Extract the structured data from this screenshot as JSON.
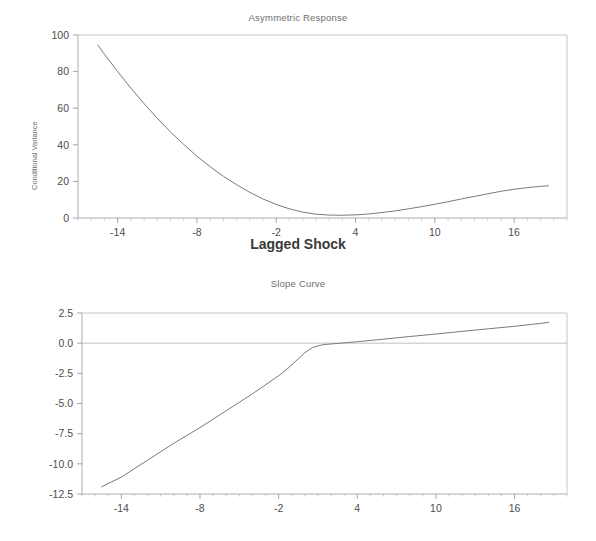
{
  "figure": {
    "width": 596,
    "height": 541,
    "background": "#ffffff",
    "line_color": "#7a7a7a",
    "text_color": "#4d4d4d",
    "axis_color": "#9a9a9a"
  },
  "chart_data": [
    {
      "type": "line",
      "title": "Asymmetric Response",
      "xlabel": "Lagged Shock",
      "ylabel": "Conditional Variance",
      "xlim": [
        -17,
        20
      ],
      "ylim": [
        0,
        100
      ],
      "xticks": [
        -14,
        -8,
        -2,
        4,
        10,
        16
      ],
      "xtick_labels": [
        "-14",
        "-8",
        "-2",
        "4",
        "10",
        "16"
      ],
      "yticks": [
        0,
        20,
        40,
        60,
        80,
        100
      ],
      "ytick_labels": [
        "0",
        "20",
        "40",
        "60",
        "80",
        "100"
      ],
      "grid": false,
      "legend": "none",
      "series": [
        {
          "name": "Conditional Variance",
          "x": [
            -15.5,
            -15.0,
            -14.0,
            -13.0,
            -12.0,
            -11.0,
            -10.0,
            -9.0,
            -8.0,
            -7.0,
            -6.0,
            -5.0,
            -4.0,
            -3.0,
            -2.0,
            -1.0,
            0.0,
            1.0,
            2.0,
            3.0,
            4.0,
            5.0,
            6.0,
            7.0,
            8.0,
            9.0,
            10.0,
            11.0,
            12.0,
            13.0,
            14.0,
            15.0,
            16.0,
            17.0,
            18.0,
            18.6
          ],
          "y": [
            94.5,
            89.5,
            80.0,
            71.0,
            62.5,
            54.5,
            47.0,
            40.2,
            33.8,
            28.0,
            22.8,
            18.2,
            14.0,
            10.4,
            7.4,
            5.0,
            3.2,
            2.1,
            1.6,
            1.5,
            1.7,
            2.2,
            3.0,
            3.9,
            5.0,
            6.2,
            7.5,
            8.9,
            10.4,
            11.8,
            13.2,
            14.6,
            15.7,
            16.6,
            17.3,
            17.6
          ]
        }
      ]
    },
    {
      "type": "line",
      "title": "Slope Curve",
      "xlabel": "",
      "ylabel": "",
      "xlim": [
        -17,
        20
      ],
      "ylim": [
        -12.5,
        2.5
      ],
      "xticks": [
        -14,
        -8,
        -2,
        4,
        10,
        16
      ],
      "xtick_labels": [
        "-14",
        "-8",
        "-2",
        "4",
        "10",
        "16"
      ],
      "yticks": [
        2.5,
        0.0,
        -2.5,
        -5.0,
        -7.5,
        -10.0,
        -12.5
      ],
      "ytick_labels": [
        "2.5",
        "0.0",
        "-2.5",
        "-5.0",
        "-7.5",
        "-10.0",
        "-12.5"
      ],
      "grid": false,
      "legend": "none",
      "series": [
        {
          "name": "Slope",
          "x": [
            -15.5,
            -14.0,
            -12.0,
            -10.0,
            -8.0,
            -6.0,
            -4.0,
            -2.0,
            -1.2,
            -0.6,
            0.0,
            0.6,
            1.4,
            2.5,
            4.0,
            6.0,
            8.0,
            10.0,
            12.0,
            14.0,
            16.0,
            18.0,
            18.6
          ],
          "y": [
            -11.9,
            -11.1,
            -9.7,
            -8.3,
            -7.0,
            -5.6,
            -4.2,
            -2.7,
            -2.0,
            -1.4,
            -0.8,
            -0.35,
            -0.12,
            -0.02,
            0.12,
            0.33,
            0.55,
            0.76,
            0.98,
            1.19,
            1.4,
            1.64,
            1.72
          ]
        }
      ]
    }
  ]
}
